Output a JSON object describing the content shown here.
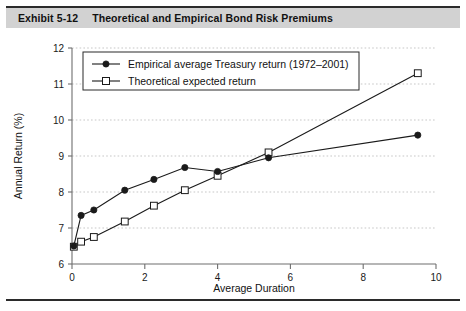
{
  "exhibit": {
    "label": "Exhibit 5-12",
    "title": "Theoretical and Empirical Bond Risk Premiums"
  },
  "colors": {
    "banner_background": "#d2d2d2",
    "rule": "#2b2b2b",
    "ink": "#1a1a1a",
    "axis": "#6e6e6e",
    "gridline": "#b9b9b9",
    "page_background": "#ffffff"
  },
  "chart_data": {
    "type": "line",
    "title": "Theoretical and Empirical Bond Risk Premiums",
    "xlabel": "Average Duration",
    "ylabel": "Annual Return (%)",
    "xlim": [
      0,
      10
    ],
    "ylim": [
      6,
      12
    ],
    "xticks": [
      0,
      2,
      4,
      6,
      8,
      10
    ],
    "xtick_labels": [
      "0",
      "2",
      "4",
      "6",
      "8",
      "10"
    ],
    "yticks": [
      6,
      7,
      8,
      9,
      10,
      11,
      12
    ],
    "ytick_labels": [
      "6",
      "7",
      "8",
      "9",
      "10",
      "11",
      "12"
    ],
    "grid": "horizontal-dotted",
    "legend_position": "upper-left-inside",
    "series": [
      {
        "name": "Empirical average Treasury return (1972–2001)",
        "marker": "filled-circle",
        "x": [
          0.05,
          0.25,
          0.6,
          1.45,
          2.25,
          3.1,
          4.0,
          5.4,
          9.5
        ],
        "values": [
          6.5,
          7.35,
          7.5,
          8.05,
          8.35,
          8.68,
          8.57,
          8.95,
          9.58
        ]
      },
      {
        "name": "Theoretical expected return",
        "marker": "open-square",
        "x": [
          0.05,
          0.25,
          0.6,
          1.45,
          2.25,
          3.1,
          4.0,
          5.4,
          9.5
        ],
        "values": [
          6.48,
          6.62,
          6.75,
          7.18,
          7.62,
          8.05,
          8.45,
          9.1,
          11.3
        ]
      }
    ]
  }
}
